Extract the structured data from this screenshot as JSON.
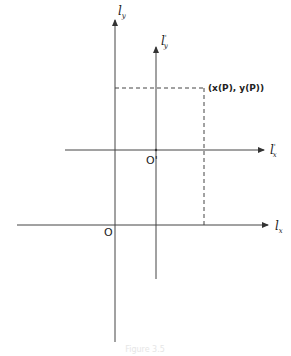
{
  "diagram": {
    "axes": {
      "l_y": {
        "label": "l",
        "sub": "y"
      },
      "l_y_prime": {
        "label": "l",
        "sub": "y",
        "prime": "'"
      },
      "l_x": {
        "label": "l",
        "sub": "x"
      },
      "l_x_prime": {
        "label": "l",
        "sub": "x",
        "prime": "'"
      }
    },
    "origins": {
      "O": "O",
      "O_prime": "O'"
    },
    "point": {
      "label": "(x(P), y(P))"
    },
    "caption": "Figure 3.5"
  },
  "colors": {
    "line": "#333333",
    "background": "#ffffff"
  }
}
